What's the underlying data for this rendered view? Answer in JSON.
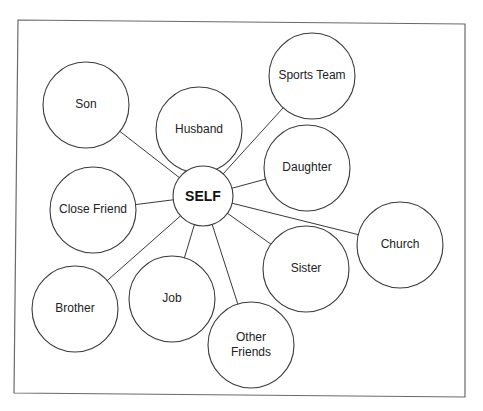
{
  "diagram": {
    "type": "relationship-map",
    "frame": {
      "x": 18,
      "y": 20,
      "width": 447,
      "height": 377
    },
    "center": {
      "id": "self",
      "label": "SELF",
      "cx": 203,
      "cy": 196,
      "r": 30
    },
    "nodes": [
      {
        "id": "son",
        "label": "Son",
        "lines": [
          "Son"
        ],
        "cx": 86,
        "cy": 105,
        "r": 43
      },
      {
        "id": "husband",
        "label": "Husband",
        "lines": [
          "Husband"
        ],
        "cx": 199,
        "cy": 130,
        "r": 43
      },
      {
        "id": "sports-team",
        "label": "Sports Team",
        "lines": [
          "Sports Team"
        ],
        "cx": 312,
        "cy": 76,
        "r": 43
      },
      {
        "id": "daughter",
        "label": "Daughter",
        "lines": [
          "Daughter"
        ],
        "cx": 307,
        "cy": 168,
        "r": 43
      },
      {
        "id": "close-friend",
        "label": "Close Friend",
        "lines": [
          "Close Friend"
        ],
        "cx": 93,
        "cy": 210,
        "r": 43
      },
      {
        "id": "church",
        "label": "Church",
        "lines": [
          "Church"
        ],
        "cx": 400,
        "cy": 245,
        "r": 43
      },
      {
        "id": "sister",
        "label": "Sister",
        "lines": [
          "Sister"
        ],
        "cx": 306,
        "cy": 269,
        "r": 43
      },
      {
        "id": "brother",
        "label": "Brother",
        "lines": [
          "Brother"
        ],
        "cx": 75,
        "cy": 309,
        "r": 43
      },
      {
        "id": "job",
        "label": "Job",
        "lines": [
          "Job"
        ],
        "cx": 172,
        "cy": 299,
        "r": 43
      },
      {
        "id": "other-friends",
        "label": "Other Friends",
        "lines": [
          "Other",
          "Friends"
        ],
        "cx": 251,
        "cy": 345,
        "r": 43
      }
    ],
    "edges": [
      {
        "from": "self",
        "to": "son"
      },
      {
        "from": "self",
        "to": "sports-team"
      },
      {
        "from": "self",
        "to": "daughter"
      },
      {
        "from": "self",
        "to": "close-friend"
      },
      {
        "from": "self",
        "to": "church"
      },
      {
        "from": "self",
        "to": "sister"
      },
      {
        "from": "self",
        "to": "brother"
      },
      {
        "from": "self",
        "to": "job"
      },
      {
        "from": "self",
        "to": "other-friends"
      }
    ],
    "colors": {
      "stroke": "#3a3a3a",
      "frame": "#6a6a6a",
      "background": "#ffffff",
      "text": "#222222"
    }
  },
  "caption": {
    "visible": "partial",
    "text": ""
  }
}
